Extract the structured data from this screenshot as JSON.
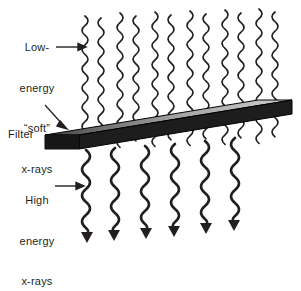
{
  "figure": {
    "background_color": "#ffffff",
    "ink_color": "#231f20"
  },
  "labels": {
    "low_energy": {
      "name": "low-energy-soft-xrays-label",
      "lines": [
        "Low-",
        "energy",
        "“soft”",
        "x-rays"
      ],
      "full_text": "Low-energy “soft” x-rays",
      "arrow": "right-arrow"
    },
    "filter": {
      "name": "filter-label",
      "lines": [
        "Filter"
      ],
      "full_text": "Filter",
      "arrow": "leader-line-down-right"
    },
    "high_energy": {
      "name": "high-energy-xrays-label",
      "lines": [
        "High",
        "energy",
        "x-rays"
      ],
      "full_text": "High energy x-rays",
      "arrow": "right-arrow"
    }
  },
  "diagram": {
    "filter_slab": {
      "name": "filter-slab",
      "top_face_gradient_from": "#4a4a4a",
      "top_face_gradient_to": "#c9c9c9",
      "side_face_color": "#1a1a1a",
      "front_face_color": "#1a1a1a",
      "edge_color": "#000000"
    },
    "incident_waves": {
      "name": "incident-wave-group",
      "count": 12,
      "description": "Low-energy soft x-rays, short wavelength, small amplitude, no arrowheads",
      "wavelength_px": 19,
      "amplitude_px": 6,
      "stroke_width": 1.7,
      "stroke_color": "#231f20"
    },
    "transmitted_waves": {
      "name": "transmitted-wave-group",
      "count": 6,
      "description": "High energy x-rays, long wavelength, large amplitude, with arrowheads",
      "wavelength_px": 26,
      "amplitude_px": 8,
      "stroke_width": 2.6,
      "stroke_color": "#231f20",
      "arrowhead": "solid-triangle-down"
    }
  }
}
